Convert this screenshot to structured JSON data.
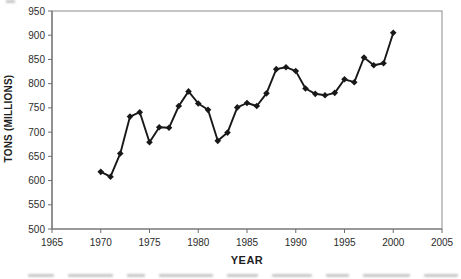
{
  "chart_data": {
    "type": "line",
    "title": "",
    "xlabel": "YEAR",
    "ylabel": "TONS (MILLIONS)",
    "x": [
      1970,
      1971,
      1972,
      1973,
      1974,
      1975,
      1976,
      1977,
      1978,
      1979,
      1980,
      1981,
      1982,
      1983,
      1984,
      1985,
      1986,
      1987,
      1988,
      1989,
      1990,
      1991,
      1992,
      1993,
      1994,
      1995,
      1996,
      1997,
      1998,
      1999,
      2000
    ],
    "values": [
      618,
      608,
      656,
      732,
      741,
      679,
      710,
      709,
      754,
      784,
      759,
      746,
      682,
      699,
      751,
      760,
      754,
      780,
      830,
      834,
      826,
      790,
      779,
      776,
      781,
      809,
      803,
      854,
      838,
      842,
      905
    ],
    "xlim": [
      1965,
      2005
    ],
    "ylim": [
      500,
      950
    ],
    "x_ticks": [
      1965,
      1970,
      1975,
      1980,
      1985,
      1990,
      1995,
      2000,
      2005
    ],
    "y_ticks": [
      500,
      550,
      600,
      650,
      700,
      750,
      800,
      850,
      900,
      950
    ],
    "grid": "off",
    "legend": "none",
    "marker": "diamond",
    "line_color": "#181818",
    "axis_color": "#6e6e6e",
    "frame_color": "#8c8c8c",
    "text_color": "#2b2b2b"
  }
}
